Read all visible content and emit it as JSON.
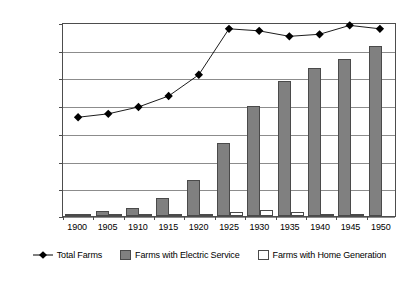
{
  "chart_data": {
    "type": "bar",
    "title": "",
    "subtitle": "",
    "xlabel": "",
    "ylabel": "",
    "categories": [
      "1900",
      "1905",
      "1910",
      "1915",
      "1920",
      "1925",
      "1930",
      "1935",
      "1940",
      "1945",
      "1950"
    ],
    "ylim": [
      0,
      140000
    ],
    "xlim_note": "categorical years 1900-1950 in 5-year steps",
    "grid": true,
    "grid_axis": "y",
    "legend_position": "bottom",
    "ytick_labels": [
      "0",
      "20,000",
      "40,000",
      "60,000",
      "80,000",
      "100,000",
      "120,000",
      "140,000"
    ],
    "ytick_values": [
      0,
      20000,
      40000,
      60000,
      80000,
      100000,
      120000,
      140000
    ],
    "series": [
      {
        "name": "Total Farms",
        "type": "line",
        "marker": "diamond",
        "color": "#000000",
        "values": [
          72000,
          74500,
          79500,
          87500,
          103000,
          136500,
          135000,
          131000,
          132500,
          139000,
          136500
        ]
      },
      {
        "name": "Farms with Electric Service",
        "type": "bar",
        "color": "#808080",
        "values": [
          800,
          3500,
          5800,
          13000,
          26000,
          53000,
          79500,
          97500,
          107000,
          113000,
          122500
        ]
      },
      {
        "name": "Farms with Home Generation",
        "type": "bar",
        "color": "#ffffff",
        "values": [
          700,
          700,
          700,
          800,
          1800,
          2700,
          4700,
          2700,
          1400,
          700,
          0
        ]
      }
    ]
  },
  "legend": {
    "entries": [
      {
        "label": "Total Farms",
        "marker": "diamond-line"
      },
      {
        "label": "Farms with Electric Service",
        "marker": "gray-box"
      },
      {
        "label": "Farms with Home Generation",
        "marker": "white-box"
      }
    ]
  },
  "colors": {
    "electric_fill": "#808080",
    "home_fill": "#ffffff",
    "line_stroke": "#000000",
    "grid": "#8c8c8c",
    "frame": "#4d4d4d",
    "background": "#ffffff"
  }
}
